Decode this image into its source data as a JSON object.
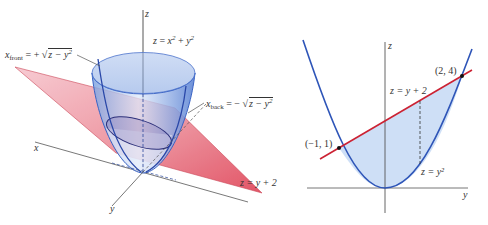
{
  "figures": {
    "left": {
      "title": "3D view: paraboloid intersected by plane",
      "axes": {
        "x_label": "x",
        "y_label": "y",
        "z_label": "z"
      },
      "surfaces": {
        "paraboloid": {
          "equation_lhs": "z",
          "equation_rhs_a": "x",
          "equation_rhs_b": "y",
          "label_text": "z = x² + y²",
          "color": "#5b86d6"
        },
        "plane": {
          "label_text": "z = y + 2",
          "color": "#e05a6a"
        }
      },
      "annotations": {
        "x_front": {
          "var": "x",
          "sub": "front",
          "sign": "= +",
          "radicand": "z − y",
          "sup": "2"
        },
        "x_back": {
          "var": "x",
          "sub": "back",
          "sign": "= −",
          "radicand": "z − y",
          "sup": "2"
        }
      }
    },
    "right": {
      "title": "Projection onto yz-plane",
      "axes": {
        "y_label": "y",
        "z_label": "z"
      },
      "curves": {
        "line": {
          "label_text": "z = y + 2",
          "color": "#cc2233"
        },
        "parabola": {
          "label_text": "z = y²",
          "color": "#2e55b8"
        }
      },
      "points": [
        {
          "label": "(−1, 1)",
          "y": -1,
          "z": 1
        },
        {
          "label": "(2, 4)",
          "y": 2,
          "z": 4
        }
      ],
      "region_fill": "#c9dcf5"
    }
  }
}
